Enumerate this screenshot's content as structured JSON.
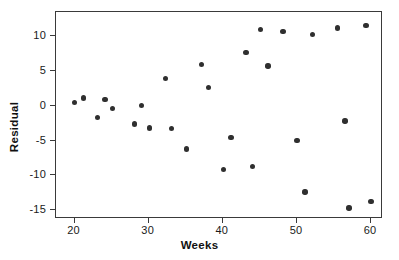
{
  "chart_data": {
    "type": "scatter",
    "title": "",
    "xlabel": "Weeks",
    "ylabel": "Residual",
    "xlim": [
      17.5,
      61.6
    ],
    "ylim": [
      -16.3,
      13.5
    ],
    "xticks": [
      20,
      30,
      40,
      50,
      60
    ],
    "xtick_labels": [
      "20",
      "30",
      "40",
      "50",
      "60"
    ],
    "yticks": [
      10,
      5,
      0,
      -5,
      -10,
      -15
    ],
    "ytick_labels": [
      "10",
      "5",
      "0",
      "-5",
      "-10",
      "-15"
    ],
    "grid": false,
    "legend": null,
    "marker": {
      "shape": "circle",
      "color": "#2f2f2f",
      "size_px": 5.4
    },
    "frame": {
      "color": "#3a3a3a",
      "box": true
    },
    "series": [
      {
        "name": "Residuals",
        "points": [
          {
            "x": 20.0,
            "y": 0.5
          },
          {
            "x": 21.2,
            "y": 1.1
          },
          {
            "x": 23.1,
            "y": -1.7
          },
          {
            "x": 24.1,
            "y": 0.9
          },
          {
            "x": 25.1,
            "y": -0.4
          },
          {
            "x": 28.1,
            "y": -2.6
          },
          {
            "x": 29.0,
            "y": 0.0
          },
          {
            "x": 30.1,
            "y": -3.2
          },
          {
            "x": 32.3,
            "y": 3.9
          },
          {
            "x": 33.1,
            "y": -3.3
          },
          {
            "x": 35.1,
            "y": -6.2
          },
          {
            "x": 37.1,
            "y": 5.9
          },
          {
            "x": 38.1,
            "y": 2.6
          },
          {
            "x": 40.1,
            "y": -9.2
          },
          {
            "x": 41.1,
            "y": -4.6
          },
          {
            "x": 43.1,
            "y": 7.7
          },
          {
            "x": 44.0,
            "y": -8.7
          },
          {
            "x": 45.1,
            "y": 11.0
          },
          {
            "x": 46.1,
            "y": 5.7
          },
          {
            "x": 48.1,
            "y": 10.7
          },
          {
            "x": 50.0,
            "y": -5.0
          },
          {
            "x": 51.1,
            "y": -12.4
          },
          {
            "x": 52.1,
            "y": 10.3
          },
          {
            "x": 55.5,
            "y": 11.2
          },
          {
            "x": 56.5,
            "y": -2.2
          },
          {
            "x": 57.0,
            "y": -14.7
          },
          {
            "x": 59.3,
            "y": 11.6
          },
          {
            "x": 60.0,
            "y": -13.8
          }
        ]
      }
    ]
  }
}
